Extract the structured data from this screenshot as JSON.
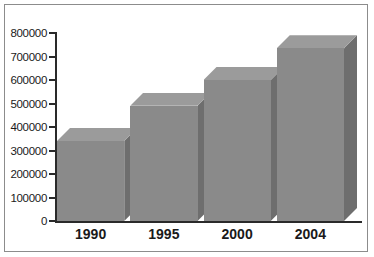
{
  "chart_data": {
    "type": "bar",
    "title": "",
    "subtitle": "",
    "xlabel": "",
    "ylabel": "",
    "categories": [
      "1990",
      "1995",
      "2000",
      "2004"
    ],
    "values": [
      340000,
      490000,
      600000,
      735000
    ],
    "series": [
      {
        "name": "",
        "values": [
          340000,
          490000,
          600000,
          735000
        ]
      }
    ],
    "ylim": [
      0,
      800000
    ],
    "ytick_labels": [
      "800000",
      "700000",
      "600000",
      "500000",
      "400000",
      "300000",
      "200000",
      "100000",
      "0"
    ],
    "ytick_values": [
      800000,
      700000,
      600000,
      500000,
      400000,
      300000,
      200000,
      100000,
      0
    ],
    "xtick_labels": [
      "1990",
      "1995",
      "2000",
      "2004"
    ],
    "grid": false,
    "legend": false,
    "legend_position": "none",
    "style": "3d-bar",
    "annotations": []
  },
  "colors": {
    "bar_front": "#8a8a8a",
    "bar_top": "#9b9b9b",
    "bar_side": "#6e6e6e",
    "axis": "#2a2a2a",
    "frame": "#8c8c8c",
    "background": "#ffffff",
    "text": "#1a1a1a"
  }
}
